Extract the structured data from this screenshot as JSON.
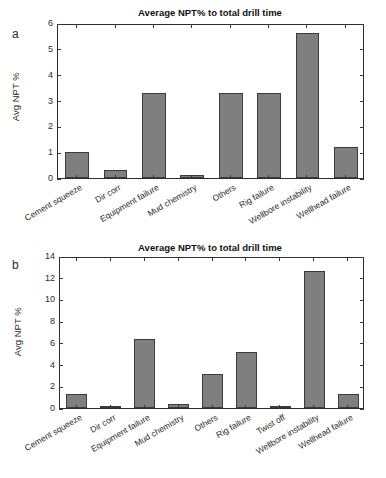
{
  "figure": {
    "panels": [
      {
        "letter": "a",
        "title": "Average NPT% to total drill time",
        "ylabel": "Avg NPT %",
        "ytick_labels": [
          "0",
          "1",
          "2",
          "3",
          "4",
          "5",
          "6"
        ],
        "categories": [
          "Cement squeeze",
          "Dir corr",
          "Equipment failure",
          "Mud chemistry",
          "Others",
          "Rig failure",
          "Wellbore instability",
          "Wellhead failure"
        ],
        "values": [
          1.0,
          0.3,
          3.3,
          0.1,
          3.3,
          3.3,
          5.6,
          1.2
        ]
      },
      {
        "letter": "b",
        "title": "Average NPT% to total drill time",
        "ylabel": "Avg NPT %",
        "ytick_labels": [
          "0",
          "2",
          "4",
          "6",
          "8",
          "10",
          "12",
          "14"
        ],
        "categories": [
          "Cement squeeze",
          "Dir corr",
          "Equipment failure",
          "Mud chemistry",
          "Others",
          "Rig failure",
          "Twist off",
          "Wellbore instability",
          "Wellhead failure"
        ],
        "values": [
          1.3,
          0.2,
          6.4,
          0.4,
          3.1,
          5.2,
          0.2,
          12.6,
          1.3
        ]
      }
    ]
  },
  "chart_data": [
    {
      "type": "bar",
      "panel": "a",
      "title": "Average NPT% to total drill time",
      "xlabel": "",
      "ylabel": "Avg NPT %",
      "ylim": [
        0,
        6
      ],
      "yticks": [
        0,
        1,
        2,
        3,
        4,
        5,
        6
      ],
      "grid": false,
      "legend": "none",
      "bar_color": "#7f7f7f",
      "bar_edge_color": "#3b3b3b",
      "categories": [
        "Cement squeeze",
        "Dir corr",
        "Equipment failure",
        "Mud chemistry",
        "Others",
        "Rig failure",
        "Wellbore instability",
        "Wellhead failure"
      ],
      "values": [
        1.0,
        0.3,
        3.3,
        0.1,
        3.3,
        3.3,
        5.6,
        1.2
      ]
    },
    {
      "type": "bar",
      "panel": "b",
      "title": "Average NPT% to total drill time",
      "xlabel": "",
      "ylabel": "Avg NPT %",
      "ylim": [
        0,
        14
      ],
      "yticks": [
        0,
        2,
        4,
        6,
        8,
        10,
        12,
        14
      ],
      "grid": false,
      "legend": "none",
      "bar_color": "#7f7f7f",
      "bar_edge_color": "#3b3b3b",
      "categories": [
        "Cement squeeze",
        "Dir corr",
        "Equipment failure",
        "Mud chemistry",
        "Others",
        "Rig failure",
        "Twist off",
        "Wellbore instability",
        "Wellhead failure"
      ],
      "values": [
        1.3,
        0.2,
        6.4,
        0.4,
        3.1,
        5.2,
        0.2,
        12.6,
        1.3
      ]
    }
  ]
}
